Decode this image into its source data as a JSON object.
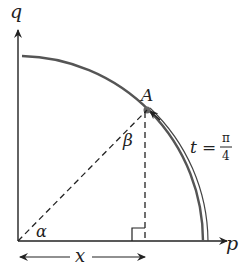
{
  "diagram": {
    "axes": {
      "horizontal_label": "p",
      "vertical_label": "q"
    },
    "point": {
      "label": "A"
    },
    "angles": {
      "at_origin": "α",
      "at_point": "β"
    },
    "parameter": {
      "lhs": "t",
      "equals": "=",
      "numerator": "π",
      "denominator": "4"
    },
    "horizontal_segment_label": "x",
    "colors": {
      "ink": "#222222",
      "arc": "#555555",
      "background": "#ffffff"
    }
  }
}
